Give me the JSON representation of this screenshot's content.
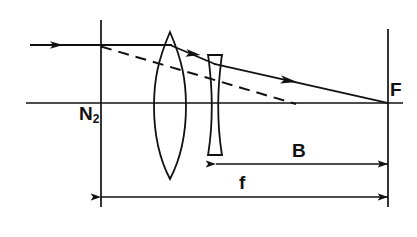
{
  "figure": {
    "type": "ray-diagram",
    "background_color": "#ffffff",
    "stroke_color": "#111111"
  },
  "labels": {
    "nodal_point": "N",
    "nodal_point_subscript": "2",
    "focal_point": "F",
    "back_focal_distance": "B",
    "equivalent_focal_length": "f"
  },
  "elements": {
    "optical_axis": {
      "name": "optical-axis",
      "x1": 26,
      "y1": 103,
      "x2": 403,
      "y2": 103
    },
    "nodal_plane": {
      "name": "nodal-plane-line",
      "x": 101,
      "y1": 20,
      "y2": 207
    },
    "focal_plane": {
      "name": "focal-plane-line",
      "x": 388,
      "y1": 29,
      "y2": 207
    },
    "converging_lens": {
      "name": "biconvex-lens",
      "type": "biconvex",
      "center_x": 170,
      "top_y": 32,
      "bottom_y": 179,
      "max_half_width": 16
    },
    "diverging_lens": {
      "name": "biconcave-lens",
      "type": "biconcave",
      "center_x": 215,
      "top_y": 55,
      "bottom_y": 155,
      "edge_half_width": 7,
      "waist_half_width": 3
    }
  },
  "rays": {
    "incident": {
      "name": "incident-ray",
      "style": "solid",
      "x1": 30,
      "y1": 45,
      "x2": 170,
      "y2": 45,
      "arrow_at_x": 62
    },
    "refracted_segment_1": {
      "name": "refracted-ray-after-convex",
      "style": "solid",
      "x1": 170,
      "y1": 45,
      "x2": 215,
      "y2": 64,
      "arrow_at_x": 199
    },
    "refracted_segment_2": {
      "name": "refracted-ray-after-concave",
      "style": "solid",
      "x1": 215,
      "y1": 64,
      "x2": 388,
      "y2": 103,
      "arrow_at_x": 296
    },
    "virtual_extension": {
      "name": "virtual-ray-dashed",
      "style": "dashed",
      "x1": 101,
      "y1": 46,
      "x2": 296,
      "y2": 104
    }
  },
  "dimensions": {
    "back_focal": {
      "name": "dimension-B",
      "label": "B",
      "y": 164,
      "x1": 216,
      "x2": 388
    },
    "focal_length": {
      "name": "dimension-f",
      "label": "f",
      "y": 197,
      "x1": 101,
      "x2": 388
    }
  }
}
